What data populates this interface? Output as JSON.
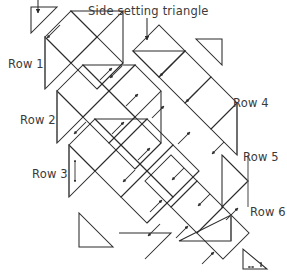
{
  "diagram": {
    "kind": "quilt-layout-diagram",
    "title_label": "Side setting triangle",
    "row_labels": [
      "Row 1",
      "Row 2",
      "Row 3",
      "Row 4",
      "Row 5",
      "Row 6"
    ],
    "colors": {
      "line": "#2b2b2b",
      "text": "#3a3a3a",
      "background": "#ffffff",
      "bracket": "#555555"
    },
    "counts": {
      "rows": 6,
      "corner_triangles": 2,
      "side_setting_triangles": 10
    }
  }
}
